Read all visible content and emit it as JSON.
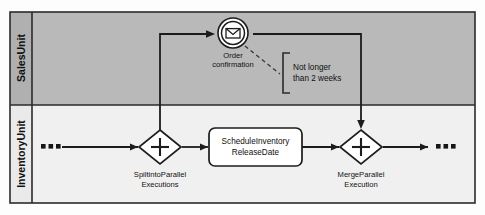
{
  "diagram": {
    "type": "bpmn-collaboration",
    "title": "",
    "pool": {
      "lanes": [
        {
          "id": "sales",
          "label": "SalesUnit",
          "fill": "#b9b9b9"
        },
        {
          "id": "inventory",
          "label": "InventoryUnit",
          "fill": "#f0f0f0"
        }
      ]
    },
    "nodes": [
      {
        "id": "start-ellipsis",
        "kind": "ellipsis",
        "label": "...",
        "lane": "inventory"
      },
      {
        "id": "split-gateway",
        "kind": "parallel-gateway",
        "label_line1": "SpiltintoParallel",
        "label_line2": "Executions",
        "lane": "inventory"
      },
      {
        "id": "schedule-task",
        "kind": "task",
        "label_line1": "ScheduleInventory",
        "label_line2": "ReleaseDate",
        "lane": "inventory"
      },
      {
        "id": "merge-gateway",
        "kind": "parallel-gateway",
        "label_line1": "MergeParallel",
        "label_line2": "Execution",
        "lane": "inventory"
      },
      {
        "id": "end-ellipsis",
        "kind": "ellipsis",
        "label": "...",
        "lane": "inventory"
      },
      {
        "id": "order-confirmation-event",
        "kind": "intermediate-message-event",
        "label_line1": "Order",
        "label_line2": "confirmation",
        "lane": "sales"
      }
    ],
    "annotations": [
      {
        "id": "duration-annotation",
        "line1": "Not longer",
        "line2": "than 2 weeks",
        "attached_to": "order-confirmation-event"
      }
    ],
    "colors": {
      "sales_lane": "#b9b9b9",
      "inventory_lane": "#f0f0f0",
      "stroke": "#1c1c1c",
      "shape_fill": "#ffffff"
    }
  }
}
